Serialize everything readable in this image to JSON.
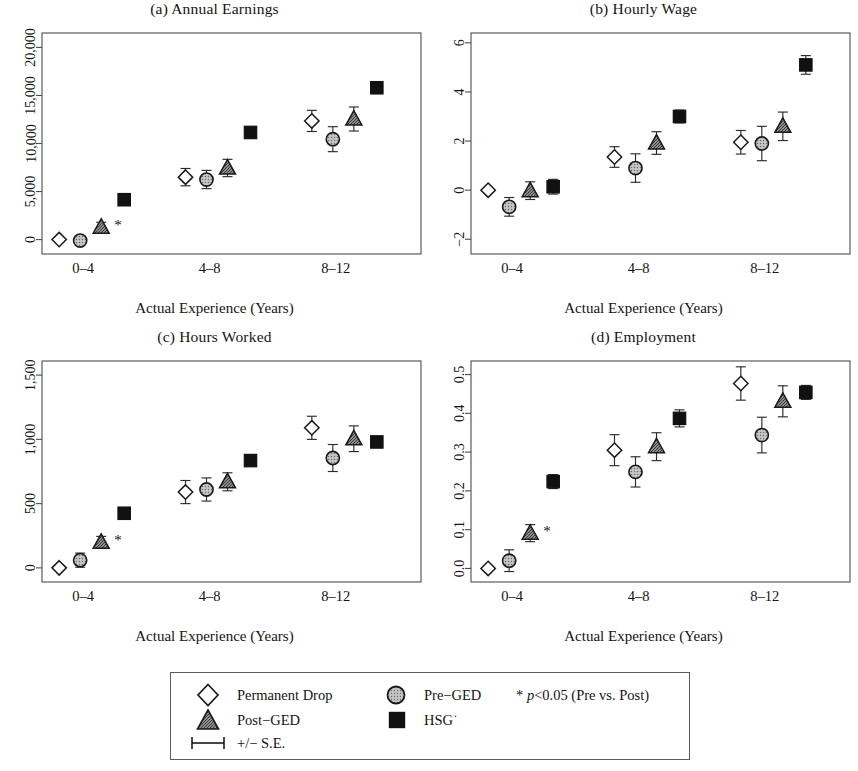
{
  "figure": {
    "x_axis_label": "Actual Experience (Years)",
    "categories": [
      "0–4",
      "4–8",
      "8–12"
    ]
  },
  "legend": {
    "items": [
      {
        "key": "permanent-drop",
        "label": "Permanent Drop",
        "marker": "diamond-open"
      },
      {
        "key": "post-ged",
        "label": "Post−GED",
        "marker": "triangle-gray"
      },
      {
        "key": "se-bar",
        "label": "+/− S.E.",
        "marker": "error-bar"
      },
      {
        "key": "pre-ged",
        "label": "Pre−GED",
        "marker": "circle-gray"
      },
      {
        "key": "hsg",
        "label": "HSG˙",
        "marker": "square-black"
      }
    ],
    "note_star": "*",
    "note_p": "p",
    "note_rest": "<0.05 (Pre vs. Post)"
  },
  "colors": {
    "axis": "#4d4d4d",
    "text": "#141414",
    "marker_open": "#ffffff",
    "marker_gray": "#a8a8a8",
    "marker_black": "#111111",
    "marker_edge": "#2b2b2b",
    "legend_border": "#5a5a5a",
    "background": "#ffffff"
  },
  "chart_data": [
    {
      "id": "panel-a",
      "type": "scatter",
      "title": "(a) Annual Earnings",
      "xlabel": "Actual Experience (Years)",
      "ylabel": "",
      "categories": [
        "0–4",
        "4–8",
        "8–12"
      ],
      "ylim": [
        -1500,
        21500
      ],
      "yticks": [
        0,
        5000,
        10000,
        15000,
        20000
      ],
      "ytick_labels": [
        "0",
        "5,000",
        "10,000",
        "15,000",
        "20,000"
      ],
      "grid": false,
      "legend_position": "below-figure",
      "series": [
        {
          "name": "Permanent Drop",
          "marker": "diamond-open",
          "values": [
            0,
            6500,
            12350
          ],
          "err": [
            0,
            900,
            1100
          ]
        },
        {
          "name": "Pre−GED",
          "marker": "circle-gray",
          "values": [
            -100,
            6250,
            10450
          ],
          "err": [
            300,
            950,
            1300
          ]
        },
        {
          "name": "Post−GED",
          "marker": "triangle-gray",
          "values": [
            1300,
            7450,
            12550
          ],
          "err": [
            500,
            900,
            1250
          ]
        },
        {
          "name": "HSG",
          "marker": "square-black",
          "values": [
            4150,
            11150,
            15800
          ],
          "err": [
            200,
            450,
            450
          ]
        }
      ],
      "annotations": [
        {
          "text": "*",
          "category": "0–4",
          "series": "Post−GED"
        }
      ]
    },
    {
      "id": "panel-b",
      "type": "scatter",
      "title": "(b) Hourly Wage",
      "xlabel": "Actual Experience (Years)",
      "ylabel": "",
      "categories": [
        "0–4",
        "4–8",
        "8–12"
      ],
      "ylim": [
        -2.6,
        6.4
      ],
      "yticks": [
        -2,
        0,
        2,
        4,
        6
      ],
      "ytick_labels": [
        "−2",
        "0",
        "2",
        "4",
        "6"
      ],
      "grid": false,
      "legend_position": "below-figure",
      "series": [
        {
          "name": "Permanent Drop",
          "marker": "diamond-open",
          "values": [
            0.0,
            1.35,
            1.95
          ],
          "err": [
            0.0,
            0.42,
            0.48
          ]
        },
        {
          "name": "Pre−GED",
          "marker": "circle-gray",
          "values": [
            -0.68,
            0.9,
            1.9
          ],
          "err": [
            0.38,
            0.58,
            0.7
          ]
        },
        {
          "name": "Post−GED",
          "marker": "triangle-gray",
          "values": [
            -0.02,
            1.92,
            2.6
          ],
          "err": [
            0.36,
            0.46,
            0.58
          ]
        },
        {
          "name": "HSG",
          "marker": "square-black",
          "values": [
            0.14,
            3.0,
            5.1
          ],
          "err": [
            0.3,
            0.26,
            0.38
          ]
        }
      ],
      "annotations": []
    },
    {
      "id": "panel-c",
      "type": "scatter",
      "title": "(c) Hours Worked",
      "xlabel": "Actual Experience (Years)",
      "ylabel": "",
      "categories": [
        "0–4",
        "4–8",
        "8–12"
      ],
      "ylim": [
        -110,
        1610
      ],
      "yticks": [
        0,
        500,
        1000,
        1500
      ],
      "ytick_labels": [
        "0",
        "500",
        "1,000",
        "1,500"
      ],
      "grid": false,
      "legend_position": "below-figure",
      "series": [
        {
          "name": "Permanent Drop",
          "marker": "diamond-open",
          "values": [
            0,
            590,
            1090
          ],
          "err": [
            0,
            90,
            90
          ]
        },
        {
          "name": "Pre−GED",
          "marker": "circle-gray",
          "values": [
            60,
            610,
            855
          ],
          "err": [
            55,
            90,
            105
          ]
        },
        {
          "name": "Post−GED",
          "marker": "triangle-gray",
          "values": [
            200,
            670,
            1005
          ],
          "err": [
            45,
            70,
            100
          ]
        },
        {
          "name": "HSG",
          "marker": "square-black",
          "values": [
            425,
            835,
            980
          ],
          "err": [
            30,
            35,
            40
          ]
        }
      ],
      "annotations": [
        {
          "text": "*",
          "category": "0–4",
          "series": "Post−GED"
        }
      ]
    },
    {
      "id": "panel-d",
      "type": "scatter",
      "title": "(d) Employment",
      "xlabel": "Actual Experience (Years)",
      "ylabel": "",
      "categories": [
        "0–4",
        "4–8",
        "8–12"
      ],
      "ylim": [
        -0.035,
        0.535
      ],
      "yticks": [
        0.0,
        0.1,
        0.2,
        0.3,
        0.4,
        0.5
      ],
      "ytick_labels": [
        "0.0",
        "0.1",
        "0.2",
        "0.3",
        "0.4",
        "0.5"
      ],
      "grid": false,
      "legend_position": "below-figure",
      "series": [
        {
          "name": "Permanent Drop",
          "marker": "diamond-open",
          "values": [
            0.0,
            0.305,
            0.477
          ],
          "err": [
            0.0,
            0.04,
            0.043
          ]
        },
        {
          "name": "Pre−GED",
          "marker": "circle-gray",
          "values": [
            0.02,
            0.249,
            0.344
          ],
          "err": [
            0.028,
            0.039,
            0.046
          ]
        },
        {
          "name": "Post−GED",
          "marker": "triangle-gray",
          "values": [
            0.091,
            0.314,
            0.431
          ],
          "err": [
            0.022,
            0.036,
            0.04
          ]
        },
        {
          "name": "HSG",
          "marker": "square-black",
          "values": [
            0.224,
            0.387,
            0.454
          ],
          "err": [
            0.018,
            0.022,
            0.018
          ]
        }
      ],
      "annotations": [
        {
          "text": "*",
          "category": "0–4",
          "series": "Post−GED"
        }
      ]
    }
  ]
}
